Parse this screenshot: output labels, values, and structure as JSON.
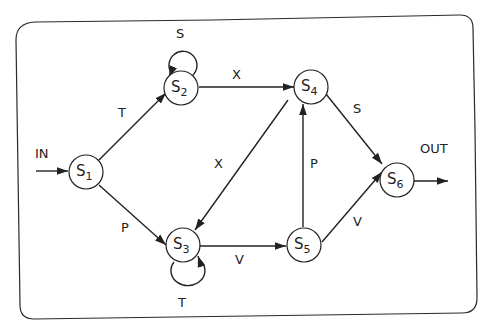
{
  "diagram": {
    "type": "finite-state-automaton",
    "nodes": [
      {
        "id": "S1",
        "label": "S",
        "sub": "1"
      },
      {
        "id": "S2",
        "label": "S",
        "sub": "2"
      },
      {
        "id": "S3",
        "label": "S",
        "sub": "3"
      },
      {
        "id": "S4",
        "label": "S",
        "sub": "4"
      },
      {
        "id": "S5",
        "label": "S",
        "sub": "5"
      },
      {
        "id": "S6",
        "label": "S",
        "sub": "6"
      }
    ],
    "edges": [
      {
        "from": "IN",
        "to": "S1",
        "label": "IN"
      },
      {
        "from": "S1",
        "to": "S2",
        "label": "T"
      },
      {
        "from": "S1",
        "to": "S3",
        "label": "P"
      },
      {
        "from": "S2",
        "to": "S2",
        "label": "S"
      },
      {
        "from": "S2",
        "to": "S4",
        "label": "X"
      },
      {
        "from": "S3",
        "to": "S3",
        "label": "T"
      },
      {
        "from": "S3",
        "to": "S5",
        "label": "V"
      },
      {
        "from": "S4",
        "to": "S3",
        "label": "X"
      },
      {
        "from": "S4",
        "to": "S6",
        "label": "S"
      },
      {
        "from": "S5",
        "to": "S4",
        "label": "P"
      },
      {
        "from": "S5",
        "to": "S6",
        "label": "V"
      },
      {
        "from": "S6",
        "to": "OUT",
        "label": "OUT"
      }
    ]
  }
}
